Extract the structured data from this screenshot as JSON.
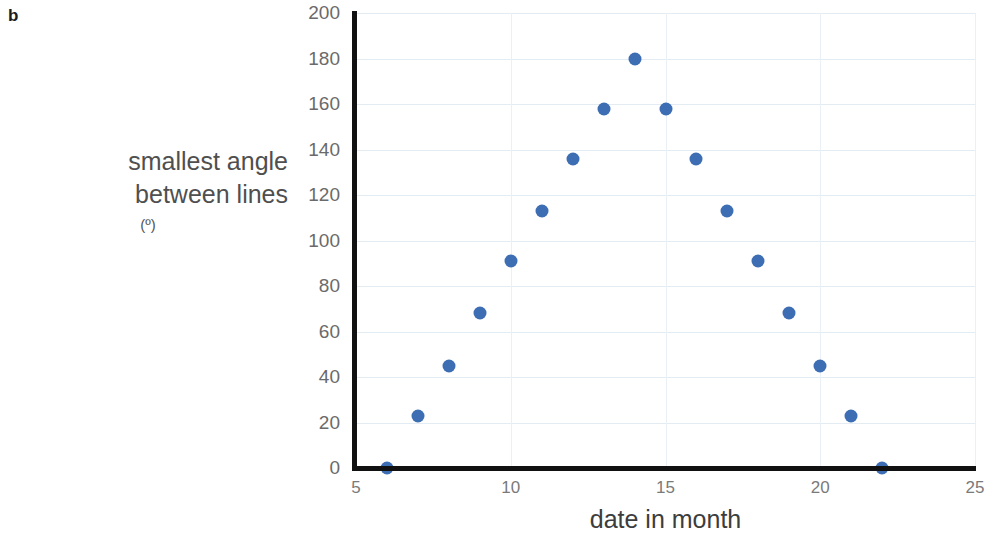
{
  "panel": {
    "label": "b"
  },
  "chart_data": {
    "type": "scatter",
    "title": "",
    "xlabel": "date in month",
    "ylabel": "smallest angle between lines",
    "ylabel_line1": "smallest angle",
    "ylabel_line2": "between lines",
    "yunit": "(º)",
    "xlim": [
      5,
      25
    ],
    "ylim": [
      0,
      200
    ],
    "xticks": [
      5,
      10,
      15,
      20,
      25
    ],
    "yticks": [
      0,
      20,
      40,
      60,
      80,
      100,
      120,
      140,
      160,
      180,
      200
    ],
    "grid": true,
    "legend": false,
    "series": [
      {
        "name": "smallest angle between lines",
        "color": "#3d6db3",
        "marker": "circle",
        "x": [
          6,
          7,
          8,
          9,
          10,
          11,
          12,
          13,
          14,
          15,
          16,
          17,
          18,
          19,
          20,
          21,
          22
        ],
        "y": [
          0,
          23,
          45,
          68,
          91,
          113,
          136,
          158,
          180,
          158,
          136,
          113,
          91,
          68,
          45,
          23,
          0
        ]
      }
    ]
  },
  "colors": {
    "marker": "#3d6db3",
    "axis": "#111111",
    "gridline": "#e3ecf3",
    "background": "#ffffff"
  }
}
